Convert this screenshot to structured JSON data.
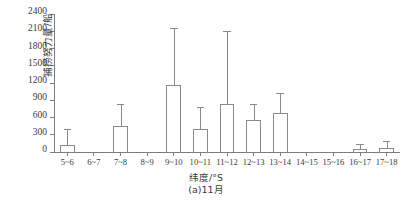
{
  "chart_data": {
    "type": "bar",
    "title": "",
    "subtitle": "",
    "categories": [
      "5~6",
      "6~7",
      "7~8",
      "8~9",
      "9~10",
      "10~11",
      "11~12",
      "12~13",
      "13~14",
      "14~15",
      "15~16",
      "16~17",
      "17~18"
    ],
    "values": [
      130,
      0,
      450,
      0,
      1170,
      400,
      830,
      560,
      670,
      0,
      0,
      45,
      70
    ],
    "errors_upper": [
      400,
      0,
      840,
      0,
      2150,
      790,
      2110,
      840,
      1030,
      0,
      0,
      140,
      190
    ],
    "xlabel": "纬度/°S",
    "ylabel": "捕捞努力量/船",
    "caption": "(a)11月",
    "ylim": [
      0,
      2400
    ],
    "yticks": [
      0,
      300,
      600,
      900,
      1200,
      1500,
      1800,
      2100,
      2400
    ],
    "ytick_labels": [
      "0",
      "300",
      "600",
      "900",
      "1200",
      "1500",
      "1800",
      "2100",
      "2400"
    ],
    "grid": false,
    "legend": null,
    "error_bar_style": "upper-whisker-with-cap",
    "bar_fill_color": "#ffffff",
    "bar_edge_color": "#8a8a8a",
    "axis_color": "#7d7d7d",
    "text_color": "#3a3a3a"
  }
}
